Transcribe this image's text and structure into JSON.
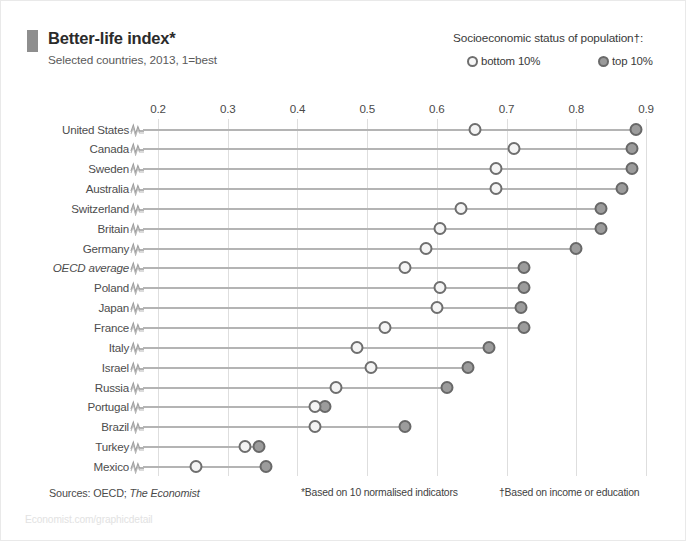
{
  "header": {
    "title": "Better-life index*",
    "subtitle": "Selected countries, 2013, 1=best",
    "marker_color": "#8e8e8e"
  },
  "legend": {
    "title": "Socioeconomic status of population†:",
    "items": [
      {
        "label": "bottom 10%",
        "marker": "hollow-circle",
        "color": "#f7f7f7",
        "stroke": "#6f6f6f"
      },
      {
        "label": "top 10%",
        "marker": "filled-circle",
        "color": "#9a9a9a",
        "stroke": "#6a6a6a"
      }
    ]
  },
  "footer": {
    "sources_prefix": "Sources: OECD;",
    "sources_italic": "The Economist",
    "footnotes": [
      "*Based on 10 normalised indicators",
      "†Based on income or education"
    ],
    "watermark": "Economist.com/graphicdetail"
  },
  "chart_data": {
    "type": "scatter",
    "title": "Better-life index*",
    "subtitle": "Selected countries, 2013, 1=best",
    "xlabel": "",
    "ylabel": "",
    "xlim": [
      0.2,
      0.9
    ],
    "xticks": [
      0.2,
      0.3,
      0.4,
      0.5,
      0.6,
      0.7,
      0.8,
      0.9
    ],
    "xtick_labels": [
      "0.2",
      "0.3",
      "0.4",
      "0.5",
      "0.6",
      "0.7",
      "0.8",
      "0.9"
    ],
    "grid": true,
    "axis_break": true,
    "legend_position": "top-right",
    "categories": [
      "United States",
      "Canada",
      "Sweden",
      "Australia",
      "Switzerland",
      "Britain",
      "Germany",
      "OECD average",
      "Poland",
      "Japan",
      "France",
      "Italy",
      "Israel",
      "Russia",
      "Portugal",
      "Brazil",
      "Turkey",
      "Mexico"
    ],
    "italic_categories": [
      "OECD average"
    ],
    "series": [
      {
        "name": "bottom 10%",
        "values": [
          0.655,
          0.71,
          0.685,
          0.685,
          0.635,
          0.605,
          0.585,
          0.555,
          0.605,
          0.6,
          0.525,
          0.485,
          0.505,
          0.455,
          0.425,
          0.425,
          0.325,
          0.255
        ]
      },
      {
        "name": "top 10%",
        "values": [
          0.885,
          0.88,
          0.88,
          0.865,
          0.835,
          0.835,
          0.8,
          0.725,
          0.725,
          0.72,
          0.725,
          0.675,
          0.645,
          0.615,
          0.44,
          0.555,
          0.345,
          0.355
        ]
      }
    ]
  }
}
